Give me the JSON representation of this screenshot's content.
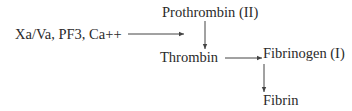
{
  "diagram": {
    "nodes": {
      "activator": "Xa/Va, PF3, Ca++",
      "prothrombin": "Prothrombin (II)",
      "thrombin": "Thrombin",
      "fibrinogen": "Fibrinogen (I)",
      "fibrin": "Fibrin"
    },
    "edges": [
      {
        "from": "activator",
        "to": "prothrombin-thrombin-arrow"
      },
      {
        "from": "prothrombin",
        "to": "thrombin"
      },
      {
        "from": "thrombin",
        "to": "fibrinogen-fibrin-arrow"
      },
      {
        "from": "fibrinogen",
        "to": "fibrin"
      }
    ],
    "colors": {
      "text": "#2a2a2a",
      "arrow": "#444444"
    }
  }
}
